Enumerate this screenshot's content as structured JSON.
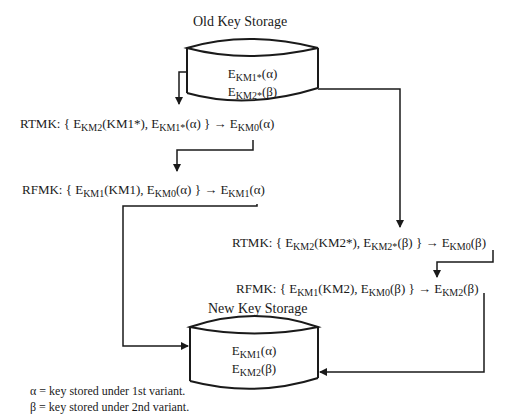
{
  "title_old": "Old Key Storage",
  "title_new": "New Key Storage",
  "old_storage": {
    "line1": {
      "base": "E",
      "sub": "KM1*",
      "arg": "(α)"
    },
    "line2": {
      "base": "E",
      "sub": "KM2*",
      "arg": "(β)"
    }
  },
  "new_storage": {
    "line1": {
      "base": "E",
      "sub": "KM1",
      "arg": "(α)"
    },
    "line2": {
      "base": "E",
      "sub": "KM2",
      "arg": "(β)"
    }
  },
  "steps": [
    {
      "op": "RTMK: { E",
      "s1": "KM2",
      "t1": "(KM1*), E",
      "s2": "KM1*",
      "t2": "(α) } → E",
      "s3": "KM0",
      "t3": "(α)"
    },
    {
      "op": "RFMK: { E",
      "s1": "KM1",
      "t1": "(KM1), E",
      "s2": "KM0",
      "t2": "(α) } → E",
      "s3": "KM1",
      "t3": "(α)"
    },
    {
      "op": "RTMK: { E",
      "s1": "KM2",
      "t1": "(KM2*), E",
      "s2": "KM2*",
      "t2": "(β) } → E",
      "s3": "KM0",
      "t3": "(β)"
    },
    {
      "op": "RFMK: { E",
      "s1": "KM1",
      "t1": "(KM2), E",
      "s2": "KM0",
      "t2": "(β) } → E",
      "s3": "KM2",
      "t3": "(β)"
    }
  ],
  "legend": [
    "α = key stored under 1st variant.",
    "β = key stored under 2nd variant."
  ]
}
